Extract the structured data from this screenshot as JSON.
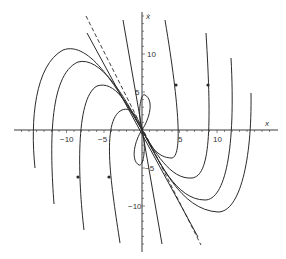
{
  "figure": {
    "type": "phase-portrait",
    "axes": {
      "x_label": "x",
      "y_label": "ẋ",
      "x_ticks": [
        {
          "value": -10,
          "label": "−10"
        },
        {
          "value": -5,
          "label": "−5"
        },
        {
          "value": 5,
          "label": "5"
        },
        {
          "value": 10,
          "label": "10"
        }
      ],
      "y_ticks": [
        {
          "value": 10,
          "label": "10"
        },
        {
          "value": 5,
          "label": "5"
        },
        {
          "value": -5,
          "label": "−5"
        },
        {
          "value": -10,
          "label": "−10"
        }
      ],
      "x_range": [
        -17,
        18
      ],
      "y_range": [
        -16,
        16
      ]
    },
    "colors": {
      "curve": "#2a2a2a",
      "axis": "#3a3a3a",
      "background": "#ffffff"
    },
    "separatrix_dashed": "slow eigendirection",
    "separatrix_solid": "fast eigendirection"
  }
}
